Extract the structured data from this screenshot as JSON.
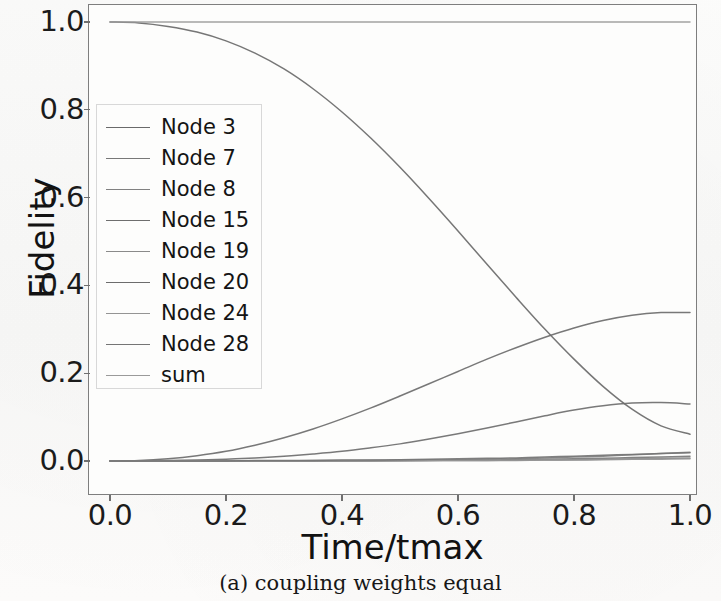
{
  "figure": {
    "caption": "(a) coupling weights equal"
  },
  "chart_data": {
    "type": "line",
    "title": "",
    "xlabel": "Time/tmax",
    "ylabel": "Fidelity",
    "xlim": [
      0.0,
      1.0
    ],
    "ylim": [
      0.0,
      1.0
    ],
    "grid": false,
    "legend_position": "upper left",
    "xticks": [
      "0.0",
      "0.2",
      "0.4",
      "0.6",
      "0.8",
      "1.0"
    ],
    "xtick_values": [
      0.0,
      0.2,
      0.4,
      0.6,
      0.8,
      1.0
    ],
    "yticks": [
      "0.0",
      "0.2",
      "0.4",
      "0.6",
      "0.8",
      "1.0"
    ],
    "ytick_values": [
      0.0,
      0.2,
      0.4,
      0.6,
      0.8,
      1.0
    ],
    "x": [
      0.0,
      0.05,
      0.1,
      0.15,
      0.2,
      0.25,
      0.3,
      0.35,
      0.4,
      0.45,
      0.5,
      0.55,
      0.6,
      0.65,
      0.7,
      0.75,
      0.8,
      0.85,
      0.9,
      0.95,
      1.0
    ],
    "series": [
      {
        "name": "Node 3",
        "color": "#6a6a6a",
        "values": [
          1.0,
          0.998,
          0.99,
          0.977,
          0.957,
          0.929,
          0.893,
          0.848,
          0.795,
          0.735,
          0.669,
          0.598,
          0.524,
          0.448,
          0.373,
          0.3,
          0.232,
          0.17,
          0.118,
          0.08,
          0.061
        ]
      },
      {
        "name": "Node 7",
        "color": "#787878",
        "values": [
          0.0,
          0.0,
          0.0,
          0.0,
          0.0,
          0.0,
          0.0,
          0.0,
          0.0,
          0.001,
          0.001,
          0.001,
          0.002,
          0.002,
          0.003,
          0.004,
          0.005,
          0.006,
          0.008,
          0.009,
          0.011
        ]
      },
      {
        "name": "Node 8",
        "color": "#818181",
        "values": [
          0.0,
          0.0,
          0.0,
          0.0,
          0.0,
          0.0,
          0.0,
          0.001,
          0.001,
          0.001,
          0.002,
          0.002,
          0.003,
          0.004,
          0.005,
          0.007,
          0.009,
          0.011,
          0.014,
          0.017,
          0.02
        ]
      },
      {
        "name": "Node 15",
        "color": "#6e6e6e",
        "values": [
          0.0,
          0.0,
          0.001,
          0.002,
          0.004,
          0.007,
          0.011,
          0.016,
          0.022,
          0.03,
          0.039,
          0.05,
          0.062,
          0.075,
          0.089,
          0.103,
          0.116,
          0.126,
          0.132,
          0.133,
          0.13
        ]
      },
      {
        "name": "Node 19",
        "color": "#8a8a8a",
        "values": [
          0.0,
          0.0,
          0.0,
          0.0,
          0.0,
          0.0,
          0.0,
          0.0,
          0.0,
          0.0,
          0.001,
          0.001,
          0.001,
          0.001,
          0.002,
          0.002,
          0.003,
          0.004,
          0.005,
          0.006,
          0.007
        ]
      },
      {
        "name": "Node 20",
        "color": "#6c6c6c",
        "values": [
          0.0,
          0.001,
          0.005,
          0.012,
          0.022,
          0.036,
          0.053,
          0.073,
          0.096,
          0.121,
          0.148,
          0.176,
          0.204,
          0.232,
          0.258,
          0.282,
          0.303,
          0.32,
          0.332,
          0.338,
          0.338
        ]
      },
      {
        "name": "Node 24",
        "color": "#949494",
        "values": [
          0.0,
          0.0,
          0.0,
          0.0,
          0.0,
          0.0,
          0.0,
          0.0,
          0.0,
          0.0,
          0.0,
          0.001,
          0.001,
          0.001,
          0.001,
          0.002,
          0.002,
          0.003,
          0.004,
          0.004,
          0.005
        ]
      },
      {
        "name": "Node 28",
        "color": "#757575",
        "values": [
          0.0,
          0.0,
          0.0,
          0.0,
          0.0,
          0.001,
          0.001,
          0.001,
          0.002,
          0.002,
          0.003,
          0.004,
          0.005,
          0.006,
          0.007,
          0.009,
          0.011,
          0.013,
          0.015,
          0.017,
          0.019
        ]
      },
      {
        "name": "sum",
        "color": "#9a9a9a",
        "values": [
          1.0,
          1.0,
          1.0,
          1.0,
          1.0,
          1.0,
          1.0,
          1.0,
          1.0,
          1.0,
          1.0,
          1.0,
          1.0,
          1.0,
          1.0,
          1.0,
          1.0,
          1.0,
          1.0,
          1.0,
          1.0
        ]
      }
    ]
  }
}
